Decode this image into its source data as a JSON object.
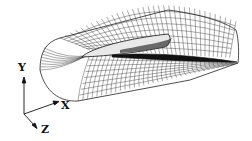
{
  "figure": {
    "colors": {
      "mesh": "#222222",
      "background": "#ffffff",
      "wing": "#111111"
    }
  },
  "axes": {
    "y_label": "Y",
    "x_label": "X",
    "z_label": "Z"
  }
}
